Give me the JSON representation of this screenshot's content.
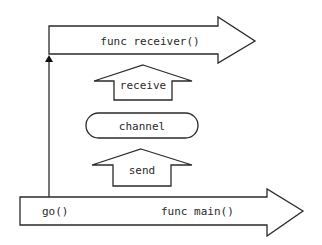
{
  "diagram": {
    "colors": {
      "stroke": "#2a2a2a",
      "fill": "#ffffff",
      "background": "#ffffff"
    },
    "nodes": {
      "receiver": {
        "label": "func receiver()",
        "shape": "right-arrow"
      },
      "receive": {
        "label": "receive",
        "shape": "up-arrow"
      },
      "channel": {
        "label": "channel",
        "shape": "pill"
      },
      "send": {
        "label": "send",
        "shape": "up-arrow"
      },
      "main": {
        "label": "func main()",
        "shape": "right-arrow"
      },
      "go_call": {
        "label": "go()"
      }
    },
    "edges": [
      {
        "from": "go_call",
        "to": "receiver",
        "style": "line-with-arrowhead",
        "direction": "up"
      }
    ]
  }
}
